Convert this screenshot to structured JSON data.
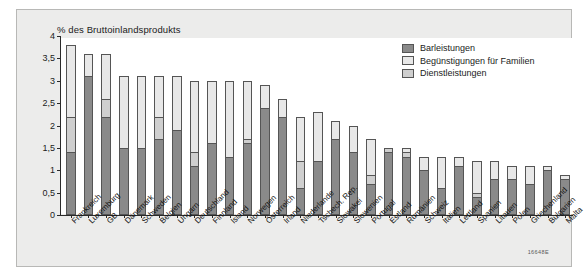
{
  "figure": {
    "code": "16648E",
    "axis_title": "% des Bruttoinlandsprodukts"
  },
  "legend": {
    "position": "top-right",
    "items": [
      {
        "label": "Barleistungen",
        "color": "#8a8a8a"
      },
      {
        "label": "Begünstigungen für Familien",
        "color": "#e8e8e8"
      },
      {
        "label": "Dienstleistungen",
        "color": "#cfcfcf"
      }
    ]
  },
  "chart_data": {
    "type": "bar",
    "stacked": true,
    "title": "",
    "subtitle": "",
    "xlabel": "",
    "ylabel": "% des Bruttoinlandsprodukts",
    "ylim": [
      0,
      4
    ],
    "ytick_labels": [
      "0",
      "0,5",
      "1",
      "1,5",
      "2",
      "2,5",
      "3",
      "3,5",
      "4"
    ],
    "ytick_values": [
      0,
      0.5,
      1,
      1.5,
      2,
      2.5,
      3,
      3.5,
      4
    ],
    "grid": false,
    "legend_position": "top-right",
    "categories": [
      "Frankreich",
      "Luxemburg",
      "GB",
      "Dänemark",
      "Schweden",
      "Belgien",
      "Ungarn",
      "Deutschland",
      "Finnland",
      "Island",
      "Norwegen",
      "Österreich",
      "Irland",
      "Niederlande",
      "Tschech. Rep.",
      "Slowakei",
      "Slowenien",
      "Portugal",
      "Estland",
      "Rumänien",
      "Schweiz",
      "Italien",
      "Lettland",
      "Spanien",
      "Litauen",
      "Polen",
      "Griechenland",
      "Bulgarien",
      "Malta"
    ],
    "series": [
      {
        "name": "Barleistungen",
        "color": "#8a8a8a",
        "values": [
          1.4,
          3.1,
          2.2,
          1.5,
          1.5,
          1.7,
          1.9,
          1.1,
          1.6,
          1.3,
          1.6,
          2.4,
          2.2,
          0.6,
          1.2,
          1.7,
          1.4,
          0.7,
          1.4,
          1.3,
          1.0,
          0.6,
          1.1,
          0.4,
          0.8,
          0.8,
          0.7,
          1.0,
          0.8
        ]
      },
      {
        "name": "Dienstleistungen",
        "color": "#cfcfcf",
        "values": [
          0.8,
          0.0,
          0.4,
          0.0,
          0.0,
          0.5,
          0.0,
          0.3,
          0.0,
          0.0,
          0.1,
          0.0,
          0.0,
          0.6,
          0.0,
          0.0,
          0.0,
          0.2,
          0.1,
          0.1,
          0.0,
          0.0,
          0.0,
          0.1,
          0.0,
          0.0,
          0.0,
          0.0,
          0.0
        ]
      },
      {
        "name": "Begünstigungen für Familien",
        "color": "#e8e8e8",
        "values": [
          1.6,
          0.5,
          1.0,
          1.6,
          1.6,
          0.9,
          1.2,
          1.6,
          1.4,
          1.7,
          1.3,
          0.5,
          0.4,
          1.0,
          1.1,
          0.4,
          0.6,
          0.8,
          0.0,
          0.1,
          0.3,
          0.7,
          0.2,
          0.7,
          0.4,
          0.3,
          0.4,
          0.1,
          0.1
        ]
      }
    ],
    "totals": [
      3.8,
      3.6,
      3.6,
      3.1,
      3.1,
      3.1,
      3.1,
      3.0,
      3.0,
      3.0,
      3.0,
      2.9,
      2.6,
      2.2,
      2.3,
      2.1,
      2.0,
      1.7,
      1.5,
      1.5,
      1.3,
      1.3,
      1.3,
      1.2,
      1.2,
      1.1,
      1.1,
      1.1,
      0.9
    ]
  }
}
